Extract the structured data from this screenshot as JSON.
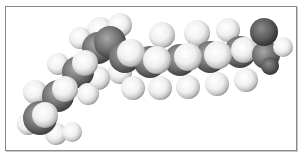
{
  "figure": {
    "colors": {
      "hydrogen": "#f4f4f4",
      "carbon": "#6e6e6e",
      "oxygen": "#5a5a5a",
      "border": "#8a8a8a"
    },
    "atoms": [
      {
        "el": "H",
        "x": 100,
        "y": 30,
        "r": 13
      },
      {
        "el": "H",
        "x": 120,
        "y": 25,
        "r": 12
      },
      {
        "el": "H",
        "x": 80,
        "y": 38,
        "r": 11
      },
      {
        "el": "C",
        "x": 98,
        "y": 48,
        "r": 16
      },
      {
        "el": "C",
        "x": 110,
        "y": 42,
        "r": 16
      },
      {
        "el": "H",
        "x": 58,
        "y": 64,
        "r": 11
      },
      {
        "el": "H",
        "x": 120,
        "y": 72,
        "r": 12
      },
      {
        "el": "H",
        "x": 98,
        "y": 78,
        "r": 12
      },
      {
        "el": "C",
        "x": 78,
        "y": 72,
        "r": 16
      },
      {
        "el": "H",
        "x": 35,
        "y": 92,
        "r": 12
      },
      {
        "el": "H",
        "x": 88,
        "y": 94,
        "r": 11
      },
      {
        "el": "C",
        "x": 58,
        "y": 96,
        "r": 16
      },
      {
        "el": "H",
        "x": 28,
        "y": 124,
        "r": 11
      },
      {
        "el": "H",
        "x": 56,
        "y": 134,
        "r": 11
      },
      {
        "el": "H",
        "x": 72,
        "y": 132,
        "r": 10
      },
      {
        "el": "C",
        "x": 40,
        "y": 118,
        "r": 17
      },
      {
        "el": "H",
        "x": 45,
        "y": 115,
        "r": 13
      },
      {
        "el": "H",
        "x": 65,
        "y": 89,
        "r": 13
      },
      {
        "el": "H",
        "x": 85,
        "y": 63,
        "r": 13
      },
      {
        "el": "H",
        "x": 162,
        "y": 35,
        "r": 13
      },
      {
        "el": "H",
        "x": 197,
        "y": 33,
        "r": 13
      },
      {
        "el": "H",
        "x": 228,
        "y": 30,
        "r": 12
      },
      {
        "el": "H",
        "x": 160,
        "y": 88,
        "r": 12
      },
      {
        "el": "H",
        "x": 188,
        "y": 87,
        "r": 12
      },
      {
        "el": "H",
        "x": 217,
        "y": 84,
        "r": 12
      },
      {
        "el": "H",
        "x": 246,
        "y": 80,
        "r": 12
      },
      {
        "el": "H",
        "x": 133,
        "y": 88,
        "r": 12
      },
      {
        "el": "C",
        "x": 125,
        "y": 57,
        "r": 16
      },
      {
        "el": "C",
        "x": 150,
        "y": 62,
        "r": 16
      },
      {
        "el": "C",
        "x": 180,
        "y": 60,
        "r": 16
      },
      {
        "el": "C",
        "x": 210,
        "y": 57,
        "r": 16
      },
      {
        "el": "C",
        "x": 240,
        "y": 52,
        "r": 16
      },
      {
        "el": "H",
        "x": 131,
        "y": 53,
        "r": 14
      },
      {
        "el": "H",
        "x": 157,
        "y": 60,
        "r": 14
      },
      {
        "el": "H",
        "x": 188,
        "y": 57,
        "r": 14
      },
      {
        "el": "H",
        "x": 218,
        "y": 55,
        "r": 14
      },
      {
        "el": "H",
        "x": 244,
        "y": 50,
        "r": 13
      },
      {
        "el": "C",
        "x": 266,
        "y": 55,
        "r": 14
      },
      {
        "el": "H",
        "x": 283,
        "y": 47,
        "r": 10
      },
      {
        "el": "O",
        "x": 264,
        "y": 32,
        "r": 14
      },
      {
        "el": "O",
        "x": 270,
        "y": 66,
        "r": 9
      }
    ]
  }
}
